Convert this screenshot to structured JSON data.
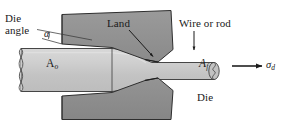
{
  "figure": {
    "type": "engineering-diagram",
    "background_color": "#ffffff",
    "die_fill_color": "#8f8f8f",
    "workpiece_fill_color": "#c6c6c6",
    "outline_color": "#262626",
    "text_color": "#1a1a1a"
  },
  "labels": {
    "die_angle_line1": "Die",
    "die_angle_line2": "angle",
    "alpha": "α",
    "land": "Land",
    "wire_or_rod": "Wire or rod",
    "area_initial": "A",
    "area_initial_sub": "o",
    "area_final": "A",
    "area_final_sub": "f",
    "drawing_stress": "σ",
    "drawing_stress_sub": "d",
    "die": "Die"
  },
  "annotations": {
    "land_arrow": "land-pointer-arrow",
    "wire_arrow": "wire-pointer-arrow",
    "stress_arrow": "drawing-stress-arrow",
    "angle_leader": "die-angle-leader-line",
    "angle_arc": "die-angle-arc"
  }
}
